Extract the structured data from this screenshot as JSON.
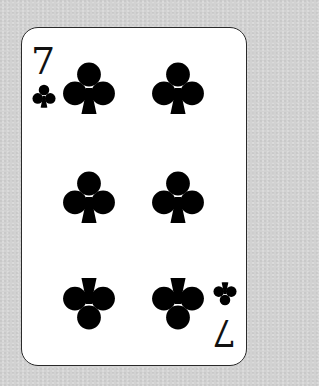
{
  "card": {
    "rank": "7",
    "suit": "clubs",
    "suit_color": "#000000",
    "background_color": "#d2d2d2",
    "card_color": "#ffffff",
    "corner_indices": [
      {
        "position": "top-left",
        "rank": "7",
        "suit_icon": "club-icon"
      },
      {
        "position": "bottom-right",
        "rank": "7",
        "suit_icon": "club-icon",
        "rotated": true
      }
    ],
    "pips": [
      {
        "row": 1,
        "col": "left",
        "rotated": false
      },
      {
        "row": 1,
        "col": "right",
        "rotated": false
      },
      {
        "row": 2,
        "col": "left",
        "rotated": false
      },
      {
        "row": 2,
        "col": "right",
        "rotated": false
      },
      {
        "row": 3,
        "col": "left",
        "rotated": true
      },
      {
        "row": 3,
        "col": "right",
        "rotated": true
      }
    ]
  }
}
